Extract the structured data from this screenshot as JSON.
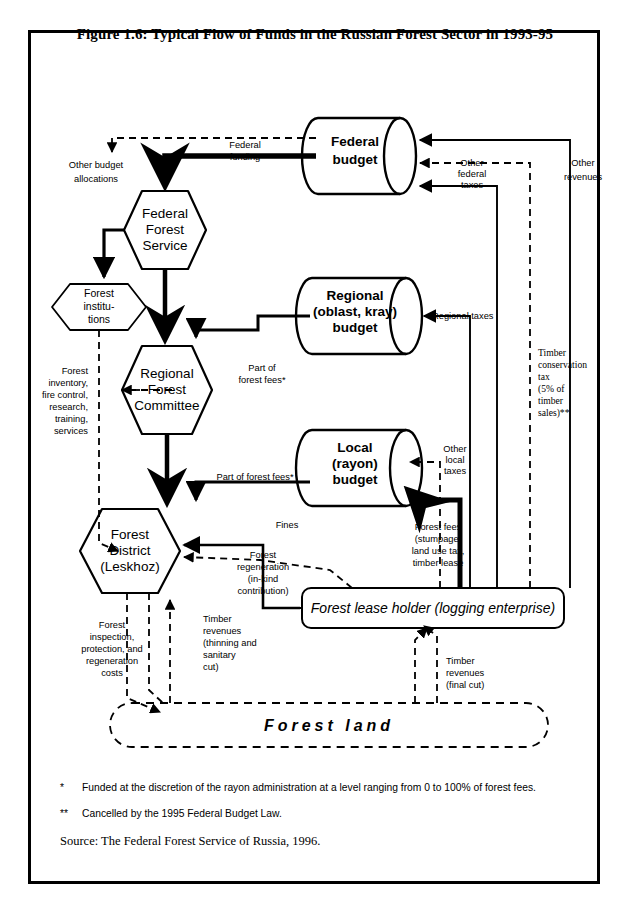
{
  "figure": {
    "title": "Figure 1.6:  Typical Flow of Funds in the Russian Forest Sector in 1993-95"
  },
  "nodes": {
    "federal_budget": "Federal\nbudget",
    "federal_budget_l1": "Federal",
    "federal_budget_l2": "budget",
    "regional_budget_l1": "Regional",
    "regional_budget_l2": "(oblast, kray)",
    "regional_budget_l3": "budget",
    "local_budget_l1": "Local",
    "local_budget_l2": "(rayon)",
    "local_budget_l3": "budget",
    "federal_forest_service_l1": "Federal",
    "federal_forest_service_l2": "Forest",
    "federal_forest_service_l3": "Service",
    "forest_institutions_l1": "Forest",
    "forest_institutions_l2": "institu-",
    "forest_institutions_l3": "tions",
    "regional_forest_committee_l1": "Regional",
    "regional_forest_committee_l2": "Forest",
    "regional_forest_committee_l3": "Committee",
    "forest_district_l1": "Forest",
    "forest_district_l2": "District",
    "forest_district_l3": "(Leskhoz)",
    "forest_lease_holder": "Forest lease holder (logging enterprise)",
    "forest_land": "Forest land"
  },
  "edge_labels": {
    "other_budget_allocations_l1": "Other budget",
    "other_budget_allocations_l2": "allocations",
    "federal_funding_l1": "Federal",
    "federal_funding_l2": "funding",
    "other_federal_taxes_l1": "Other",
    "other_federal_taxes_l2": "federal",
    "other_federal_taxes_l3": "taxes",
    "other_revenues_l1": "Other",
    "other_revenues_l2": "revenues",
    "regional_taxes": "Regional taxes",
    "other_local_taxes_l1": "Other",
    "other_local_taxes_l2": "local",
    "other_local_taxes_l3": "taxes",
    "timber_conservation_tax_l1": "Timber",
    "timber_conservation_tax_l2": "conservation",
    "timber_conservation_tax_l3": "tax",
    "timber_conservation_tax_l4": "(5% of",
    "timber_conservation_tax_l5": "timber",
    "timber_conservation_tax_l6": "sales)**",
    "forest_services_l1": "Forest",
    "forest_services_l2": "inventory,",
    "forest_services_l3": "fire control,",
    "forest_services_l4": "research,",
    "forest_services_l5": "training,",
    "forest_services_l6": "services",
    "part_of_forest_fees_vertical_l1": "Part of",
    "part_of_forest_fees_vertical_l2": "forest fees*",
    "part_of_forest_fees_horizontal": "Part of forest fees*",
    "fines": "Fines",
    "forest_regeneration_l1": "Forest",
    "forest_regeneration_l2": "regeneration",
    "forest_regeneration_l3": "(in-kind",
    "forest_regeneration_l4": "contribution)",
    "forest_fees_l1": "Forest fees",
    "forest_fees_l2": "(stumpage,",
    "forest_fees_l3": "land use tax,",
    "forest_fees_l4": "timber lease",
    "forest_inspection_l1": "Forest",
    "forest_inspection_l2": "inspection,",
    "forest_inspection_l3": "protection, and",
    "forest_inspection_l4": "regeneration",
    "forest_inspection_l5": "costs",
    "timber_revenues_thinning_l1": "Timber",
    "timber_revenues_thinning_l2": "revenues",
    "timber_revenues_thinning_l3": "(thinning and",
    "timber_revenues_thinning_l4": "sanitary",
    "timber_revenues_thinning_l5": "cut)",
    "timber_revenues_final_l1": "Timber",
    "timber_revenues_final_l2": "revenues",
    "timber_revenues_final_l3": "(final cut)"
  },
  "footnotes": {
    "single_marker": "*",
    "single_text": "Funded at the discretion of the rayon administration at a level ranging from 0 to 100% of forest fees.",
    "double_marker": "**",
    "double_text": "Cancelled by the 1995 Federal Budget Law.",
    "source": "Source: The Federal Forest Service of Russia, 1996."
  },
  "colors": {
    "ink": "#000000",
    "paper": "#ffffff"
  }
}
